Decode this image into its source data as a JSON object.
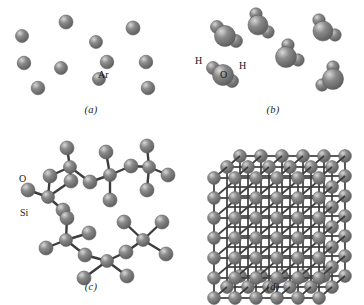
{
  "figure": {
    "background": "#ffffff",
    "sphere_color": "#8a8a8a",
    "sphere_dark": "#5e5e5e",
    "sphere_light": "#d8d8d8",
    "bond_color": "#3d3d3d"
  },
  "panels": [
    {
      "id": "a",
      "caption": "(a)",
      "subject": "monatomic-gas-argon",
      "labels": [
        {
          "text": "Ar",
          "x": 98,
          "y": 76
        }
      ],
      "atoms": [
        {
          "cx": 22,
          "cy": 36,
          "r": 6.5
        },
        {
          "cx": 66,
          "cy": 22,
          "r": 7.0
        },
        {
          "cx": 96,
          "cy": 42,
          "r": 6.5
        },
        {
          "cx": 133,
          "cy": 28,
          "r": 7.0
        },
        {
          "cx": 24,
          "cy": 63,
          "r": 6.8
        },
        {
          "cx": 61,
          "cy": 68,
          "r": 6.5
        },
        {
          "cx": 107,
          "cy": 62,
          "r": 6.8
        },
        {
          "cx": 146,
          "cy": 62,
          "r": 6.8
        },
        {
          "cx": 38,
          "cy": 88,
          "r": 6.8
        },
        {
          "cx": 99,
          "cy": 79,
          "r": 6.5
        },
        {
          "cx": 148,
          "cy": 88,
          "r": 6.8
        }
      ]
    },
    {
      "id": "b",
      "caption": "(b)",
      "subject": "water-molecules",
      "labels": [
        {
          "text": "H",
          "x": 13,
          "y": 62
        },
        {
          "text": "O",
          "x": 38,
          "y": 76
        },
        {
          "text": "H",
          "x": 57,
          "y": 67
        }
      ],
      "molecules": [
        {
          "ox": 43,
          "oy": 36,
          "orr": 10.5,
          "h": [
            {
              "dx": -8,
              "dy": -9,
              "r": 6.5
            },
            {
              "dx": 11,
              "dy": 5,
              "r": 6.5
            }
          ]
        },
        {
          "ox": 76,
          "oy": 25,
          "orr": 10.0,
          "h": [
            {
              "dx": -2,
              "dy": -11,
              "r": 6.2
            },
            {
              "dx": 10,
              "dy": 7,
              "r": 6.2
            }
          ]
        },
        {
          "ox": 141,
          "oy": 31,
          "orr": 10.0,
          "h": [
            {
              "dx": -4,
              "dy": -11,
              "r": 6.2
            },
            {
              "dx": 12,
              "dy": 4,
              "r": 6.2
            }
          ]
        },
        {
          "ox": 104,
          "oy": 57,
          "orr": 10.5,
          "h": [
            {
              "dx": 2,
              "dy": -12,
              "r": 6.2
            },
            {
              "dx": 12,
              "dy": 3,
              "r": 6.2
            }
          ]
        },
        {
          "ox": 41,
          "oy": 75,
          "orr": 10.5,
          "h": [
            {
              "dx": -10,
              "dy": -7,
              "r": 6.5
            },
            {
              "dx": 9,
              "dy": 6,
              "r": 6.5
            }
          ]
        },
        {
          "ox": 151,
          "oy": 79,
          "orr": 10.5,
          "h": [
            {
              "dx": 0,
              "dy": -12,
              "r": 6.2
            },
            {
              "dx": -11,
              "dy": 6,
              "r": 6.2
            }
          ]
        }
      ]
    },
    {
      "id": "c",
      "caption": "(c)",
      "subject": "amorphous-silica-network",
      "labels": [
        {
          "text": "O",
          "x": 19,
          "y": 50
        },
        {
          "text": "Si",
          "x": 20,
          "y": 84
        }
      ],
      "silicon": [
        {
          "cx": 48,
          "cy": 67,
          "r": 6.5
        },
        {
          "cx": 70,
          "cy": 37,
          "r": 6.5
        },
        {
          "cx": 110,
          "cy": 45,
          "r": 6.5
        },
        {
          "cx": 149,
          "cy": 37,
          "r": 6.5
        },
        {
          "cx": 66,
          "cy": 110,
          "r": 6.5
        },
        {
          "cx": 107,
          "cy": 131,
          "r": 6.5
        },
        {
          "cx": 143,
          "cy": 110,
          "r": 6.5
        }
      ],
      "oxygen": [
        {
          "cx": 28,
          "cy": 60,
          "r": 7.0
        },
        {
          "cx": 50,
          "cy": 46,
          "r": 7.0
        },
        {
          "cx": 67,
          "cy": 18,
          "r": 7.0
        },
        {
          "cx": 71,
          "cy": 51,
          "r": 7.0
        },
        {
          "cx": 90,
          "cy": 52,
          "r": 7.0
        },
        {
          "cx": 106,
          "cy": 22,
          "r": 7.0
        },
        {
          "cx": 110,
          "cy": 70,
          "r": 7.0
        },
        {
          "cx": 131,
          "cy": 36,
          "r": 7.0
        },
        {
          "cx": 147,
          "cy": 16,
          "r": 7.0
        },
        {
          "cx": 168,
          "cy": 45,
          "r": 7.0
        },
        {
          "cx": 147,
          "cy": 60,
          "r": 7.0
        },
        {
          "cx": 63,
          "cy": 80,
          "r": 7.0
        },
        {
          "cx": 67,
          "cy": 88,
          "r": 7.0
        },
        {
          "cx": 46,
          "cy": 118,
          "r": 7.0
        },
        {
          "cx": 89,
          "cy": 103,
          "r": 7.0
        },
        {
          "cx": 85,
          "cy": 125,
          "r": 7.0
        },
        {
          "cx": 84,
          "cy": 148,
          "r": 7.0
        },
        {
          "cx": 127,
          "cy": 146,
          "r": 7.0
        },
        {
          "cx": 126,
          "cy": 122,
          "r": 7.0
        },
        {
          "cx": 124,
          "cy": 92,
          "r": 7.0
        },
        {
          "cx": 162,
          "cy": 92,
          "r": 7.0
        },
        {
          "cx": 166,
          "cy": 124,
          "r": 7.0
        }
      ],
      "bonds": [
        [
          28,
          60,
          48,
          67
        ],
        [
          50,
          46,
          48,
          67
        ],
        [
          48,
          67,
          71,
          51
        ],
        [
          48,
          67,
          63,
          80
        ],
        [
          50,
          46,
          70,
          37
        ],
        [
          70,
          37,
          67,
          18
        ],
        [
          70,
          37,
          71,
          51
        ],
        [
          70,
          37,
          90,
          52
        ],
        [
          90,
          52,
          110,
          45
        ],
        [
          110,
          45,
          106,
          22
        ],
        [
          110,
          45,
          110,
          70
        ],
        [
          110,
          45,
          131,
          36
        ],
        [
          131,
          36,
          149,
          37
        ],
        [
          149,
          37,
          147,
          16
        ],
        [
          149,
          37,
          168,
          45
        ],
        [
          149,
          37,
          147,
          60
        ],
        [
          63,
          80,
          67,
          88
        ],
        [
          67,
          88,
          66,
          110
        ],
        [
          66,
          110,
          46,
          118
        ],
        [
          66,
          110,
          89,
          103
        ],
        [
          66,
          110,
          85,
          125
        ],
        [
          85,
          125,
          107,
          131
        ],
        [
          107,
          131,
          84,
          148
        ],
        [
          107,
          131,
          127,
          146
        ],
        [
          107,
          131,
          126,
          122
        ],
        [
          126,
          122,
          143,
          110
        ],
        [
          143,
          110,
          124,
          92
        ],
        [
          143,
          110,
          162,
          92
        ],
        [
          143,
          110,
          166,
          124
        ]
      ]
    },
    {
      "id": "d",
      "caption": "(d)",
      "subject": "crystalline-cubic-lattice",
      "grid": {
        "cols": 6,
        "rows": 7,
        "depth": 3,
        "spacing_x": 21,
        "spacing_y": 20,
        "dx": 13,
        "dy": -11,
        "origin_x": 32,
        "origin_y": 48,
        "r": 6.4
      }
    }
  ]
}
